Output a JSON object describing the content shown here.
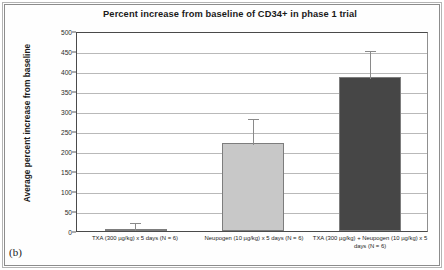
{
  "figure": {
    "panel_letter": "(b)",
    "background": "#ffffff"
  },
  "chart_data": {
    "type": "bar",
    "title": "Percent increase from baseline of CD34+ in phase 1 trial",
    "xlabel": "",
    "ylabel": "Average percent increase from baseline",
    "ylim": [
      0,
      500
    ],
    "ytick_step": 50,
    "yticks": [
      500,
      450,
      400,
      350,
      300,
      250,
      200,
      150,
      100,
      50,
      0
    ],
    "ytick_labels": [
      "500",
      "450",
      "400",
      "350",
      "300",
      "250",
      "200",
      "150",
      "100",
      "50",
      "0"
    ],
    "grid": true,
    "legend": "none",
    "categories": [
      "TXA (300 µg/kg) x 5 days (N = 6)",
      "Neupogen (10 µg/kg) x 5 days (N = 6)",
      "TXA (300 µg/kg) + Neupogen (10 µg/kg) x 5 days (N = 6)"
    ],
    "values": [
      5,
      220,
      385
    ],
    "errors": [
      20,
      65,
      70
    ],
    "bar_colors": [
      "#d4d4d4",
      "#c8c8c8",
      "#464646"
    ],
    "bar_edge_color": "#7d7d7d",
    "error_color": "#8a8a8a"
  },
  "x_label_lines": {
    "bar1": [
      "TXA (300 µg/kg) x 5 days (N = 6)"
    ],
    "bar2": [
      "Neupogen (10 µg/kg) x 5 days (N = 6)"
    ],
    "bar3": [
      "TXA (300 µg/kg) + Neupogen (10 µg/kg) x 5",
      "days (N = 6)"
    ]
  }
}
